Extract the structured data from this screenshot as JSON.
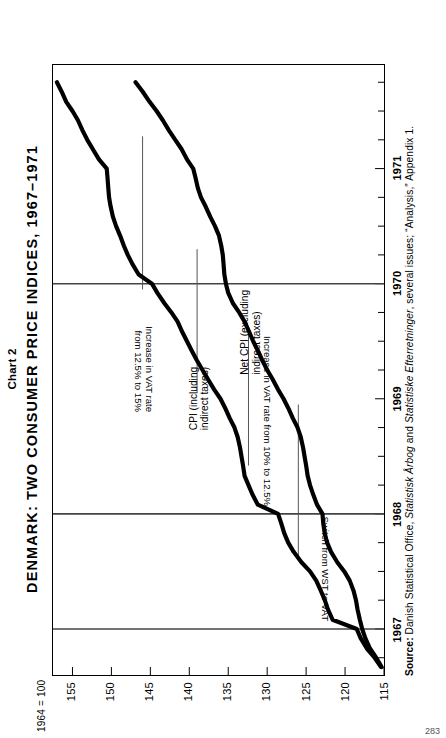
{
  "figure": {
    "chart_number": "Chart 2",
    "title": "DENMARK:  TWO  CONSUMER  PRICE  INDICES,  1967–1971",
    "base_note": "1964 = 100",
    "page_number": "283"
  },
  "source": {
    "label": "Source:",
    "text_a": "Danish Statistical Office, ",
    "italic_a": "Statistisk Årbog",
    "text_b": " and ",
    "italic_b": "Statistiske Efterretninger",
    "text_c": ", several issues; “Analysis,” Appendix 1."
  },
  "annotations": [
    {
      "id": "wst-to-vat",
      "text": "Switch from WST to VAT"
    },
    {
      "id": "vat-10-125",
      "text": "Increase in VAT rate from 10% to 12.5%"
    },
    {
      "id": "vat-125-15-line1",
      "text": "Increase in VAT rate"
    },
    {
      "id": "vat-125-15-line2",
      "text": "from 12.5% to 15%"
    }
  ],
  "series_labels": {
    "cpi_line1": "CPI (including",
    "cpi_line2": "indirect taxes)",
    "netcpi_line1": "Net CPI (excluding",
    "netcpi_line2": "indirect taxes)"
  },
  "chart_data": {
    "type": "line",
    "title": "DENMARK: TWO CONSUMER PRICE INDICES, 1967–1971",
    "xlabel": "",
    "ylabel": "1964 = 100",
    "xlim": [
      1966.6,
      1971.9
    ],
    "ylim": [
      115,
      157.5
    ],
    "yticks": [
      115,
      120,
      125,
      130,
      135,
      140,
      145,
      150,
      155
    ],
    "ytick_labels": [
      "115",
      "120",
      "125",
      "130",
      "135",
      "140",
      "145",
      "150",
      "155"
    ],
    "xticks": [
      1967,
      1968,
      1969,
      1970,
      1971
    ],
    "xtick_labels": [
      "1967",
      "1968",
      "1969",
      "1970",
      "1971"
    ],
    "minor_xtick_step": 0.25,
    "grid": false,
    "legend": "inline-labels",
    "event_lines": [
      {
        "x": 1967.0,
        "label": "Switch from WST to VAT"
      },
      {
        "x": 1968.0,
        "label": "Increase in VAT rate from 10% to 12.5%"
      },
      {
        "x": 1970.0,
        "label": "Increase in VAT rate from 12.5% to 15%"
      }
    ],
    "x": [
      1966.67,
      1966.75,
      1966.83,
      1966.92,
      1967.0,
      1967.08,
      1967.17,
      1967.25,
      1967.33,
      1967.42,
      1967.5,
      1967.58,
      1967.67,
      1967.75,
      1967.83,
      1967.92,
      1968.0,
      1968.08,
      1968.17,
      1968.25,
      1968.33,
      1968.42,
      1968.5,
      1968.58,
      1968.67,
      1968.75,
      1968.83,
      1968.92,
      1969.0,
      1969.08,
      1969.17,
      1969.25,
      1969.33,
      1969.42,
      1969.5,
      1969.58,
      1969.67,
      1969.75,
      1969.83,
      1969.92,
      1970.0,
      1970.08,
      1970.17,
      1970.25,
      1970.33,
      1970.42,
      1970.5,
      1970.58,
      1970.67,
      1970.75,
      1970.83,
      1970.92,
      1971.0,
      1971.08,
      1971.17,
      1971.25,
      1971.33,
      1971.42,
      1971.5,
      1971.58,
      1971.67,
      1971.75
    ],
    "series": [
      {
        "name": "CPI (including indirect taxes)",
        "values": [
          115.4,
          116.2,
          117.2,
          118.0,
          118.5,
          121.6,
          122.2,
          122.6,
          123.1,
          123.7,
          124.5,
          125.6,
          126.6,
          127.3,
          127.8,
          128.2,
          128.6,
          131.2,
          131.9,
          132.4,
          132.9,
          133.1,
          133.3,
          133.5,
          133.8,
          134.2,
          134.8,
          135.4,
          136.0,
          136.8,
          137.6,
          138.3,
          139.0,
          139.7,
          140.3,
          140.9,
          141.5,
          142.3,
          143.2,
          144.1,
          144.8,
          146.5,
          147.3,
          147.9,
          148.4,
          148.9,
          149.4,
          149.8,
          150.1,
          150.3,
          150.4,
          150.5,
          150.6,
          151.6,
          152.4,
          153.1,
          153.7,
          154.3,
          155.0,
          155.8,
          156.4,
          157.0
        ],
        "style": "thick-solid"
      },
      {
        "name": "Net CPI (excluding indirect taxes)",
        "values": [
          115.3,
          116.0,
          116.8,
          117.4,
          117.8,
          118.1,
          118.4,
          118.6,
          118.9,
          119.4,
          120.1,
          121.0,
          121.8,
          122.3,
          122.6,
          122.8,
          122.9,
          123.6,
          124.1,
          124.5,
          124.8,
          125.0,
          125.2,
          125.4,
          125.7,
          126.1,
          126.7,
          127.3,
          127.9,
          128.6,
          129.3,
          130.0,
          130.6,
          131.2,
          131.8,
          132.3,
          132.9,
          133.6,
          134.4,
          135.0,
          135.3,
          135.5,
          135.6,
          135.7,
          135.9,
          136.2,
          136.7,
          137.3,
          137.9,
          138.5,
          138.9,
          139.2,
          139.5,
          140.3,
          141.0,
          141.8,
          142.6,
          143.4,
          144.2,
          145.1,
          146.0,
          146.9
        ],
        "style": "thick-solid"
      }
    ]
  }
}
